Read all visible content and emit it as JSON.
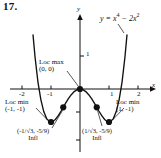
{
  "figure": {
    "number": "17.",
    "equation_plain": "y = x^4 - 2x^2"
  },
  "chart_data": {
    "type": "line",
    "title": "",
    "equation": "y = x⁴ − 2x²",
    "xlabel": "x",
    "ylabel": "y",
    "xlim": [
      -2.45,
      2.45
    ],
    "ylim": [
      -2.4,
      2.6
    ],
    "xticks": [
      -2,
      -1,
      1,
      2
    ],
    "xticklabels": [
      "-2",
      "-1",
      "1",
      "2"
    ],
    "yticks": [
      1
    ],
    "yticklabels": [
      "1"
    ],
    "grid": false,
    "legend": "none",
    "x": [
      -1.62,
      -1.55,
      -1.45,
      -1.35,
      -1.25,
      -1.15,
      -1.05,
      -1.0,
      -0.95,
      -0.85,
      -0.75,
      -0.65,
      -0.577,
      -0.5,
      -0.4,
      -0.3,
      -0.2,
      -0.1,
      0.0,
      0.1,
      0.2,
      0.3,
      0.4,
      0.5,
      0.577,
      0.65,
      0.75,
      0.85,
      0.95,
      1.0,
      1.05,
      1.15,
      1.25,
      1.35,
      1.45,
      1.55,
      1.62
    ],
    "y": [
      1.64,
      0.97,
      0.21,
      -0.32,
      -0.683,
      -0.898,
      -0.988,
      -1.0,
      -0.991,
      -0.923,
      -0.809,
      -0.667,
      -0.5556,
      -0.4375,
      -0.2944,
      -0.1719,
      -0.0784,
      -0.0199,
      0.0,
      -0.0199,
      -0.0784,
      -0.1719,
      -0.2944,
      -0.4375,
      -0.5556,
      -0.667,
      -0.809,
      -0.923,
      -0.991,
      -1.0,
      -0.988,
      -0.898,
      -0.683,
      -0.32,
      0.21,
      0.97,
      1.64
    ],
    "points": [
      {
        "name": "local-maximum",
        "x": 0,
        "y": 0,
        "label": "Loc max (0, 0)"
      },
      {
        "name": "local-minimum-left",
        "x": -1,
        "y": -1,
        "label": "Loc min (-1, -1)"
      },
      {
        "name": "local-minimum-right",
        "x": 1,
        "y": -1,
        "label": "Loc min (1, -1)"
      },
      {
        "name": "inflection-left",
        "x": -0.5774,
        "y": -0.5556,
        "label": "(-1/√3, -5/9) Infl"
      },
      {
        "name": "inflection-right",
        "x": 0.5774,
        "y": -0.5556,
        "label": "(1/√3, -5/9) Infl"
      }
    ]
  },
  "labels": {
    "axis_x": "x",
    "axis_y": "y",
    "tick_minus2": "-2",
    "tick_minus1": "-1",
    "tick_plus1": "1",
    "tick_plus2": "2",
    "tick_y1": "1",
    "loc_max_line1": "Loc max",
    "loc_max_line2": "(0, 0)",
    "loc_min_left_line1": "Loc min",
    "loc_min_left_line2": "(-1, -1)",
    "loc_min_right_line1": "Loc min",
    "loc_min_right_line2": "(1, -1)",
    "infl_left_coords": "(-1/√3, -5/9)",
    "infl_left_word": "Infl",
    "infl_right_coords": "(1/√3, -5/9)",
    "infl_right_word": "Infl",
    "equation_y": "y = x",
    "equation_exp1": "4",
    "equation_mid": " − 2x",
    "equation_exp2": "2"
  }
}
